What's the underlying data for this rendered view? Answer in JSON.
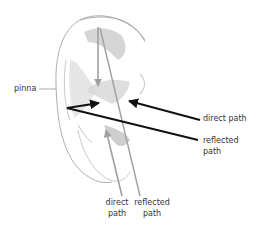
{
  "diagram": {
    "labels": {
      "pinna": "pinna",
      "right_direct": "direct path",
      "right_reflected_1": "reflected",
      "right_reflected_2": "path",
      "bottom_direct_1": "direct",
      "bottom_direct_2": "path",
      "bottom_reflected_1": "reflected",
      "bottom_reflected_2": "path"
    },
    "colors": {
      "black_path": "#111111",
      "gray_path": "#a0a0a0",
      "outline": "#9a9a9a",
      "shading": "#c8c8c8",
      "text": "#333333"
    }
  }
}
